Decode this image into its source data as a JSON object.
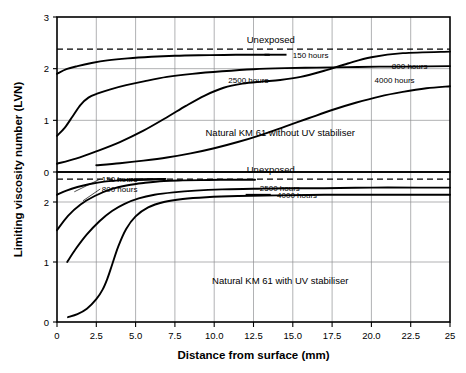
{
  "chart_data": {
    "type": "line",
    "title": "",
    "xlabel": "Distance from surface (mm)",
    "ylabel": "Limiting viscosity number (LVN)",
    "xlim": [
      0,
      25
    ],
    "xticks": [
      "0",
      "2.5",
      "5.0",
      "7.5",
      "10.0",
      "12.5",
      "15.0",
      "17.5",
      "20.0",
      "22.5",
      "25"
    ],
    "xtick_values": [
      0,
      2.5,
      5,
      7.5,
      10,
      12.5,
      15,
      17.5,
      20,
      22.5,
      25
    ],
    "grid": true,
    "legend_position": "inline-annotations",
    "panels": [
      {
        "name": "top",
        "annotation": "Natural KM 61 without UV stabiliser",
        "unexposed_label": "Unexposed",
        "unexposed_value": 2.38,
        "ylim": [
          0,
          3
        ],
        "yticks": [
          "0",
          "1",
          "2",
          "3"
        ],
        "ytick_values": [
          0,
          1,
          2,
          3
        ],
        "series": [
          {
            "name": "150 hours",
            "label": "150 hours",
            "x": [
              0,
              0.6,
              1.3,
              2.2,
              3.2,
              4.5,
              6.0,
              7.5,
              9.0,
              10.6,
              12.0,
              13.5
            ],
            "y": [
              1.9,
              1.99,
              2.05,
              2.11,
              2.16,
              2.2,
              2.23,
              2.25,
              2.26,
              2.265,
              2.27,
              2.27
            ]
          },
          {
            "name": "800 hours",
            "label": "800 hours",
            "x": [
              0,
              0.5,
              1.0,
              1.5,
              2.0,
              2.6,
              3.4,
              4.4,
              5.6,
              7.0,
              8.6,
              10.5,
              12.5,
              14.5,
              16.5,
              18.5,
              20.5,
              22.5,
              25
            ],
            "y": [
              0.7,
              0.86,
              1.08,
              1.3,
              1.44,
              1.52,
              1.6,
              1.68,
              1.76,
              1.84,
              1.9,
              1.95,
              1.99,
              2.01,
              2.02,
              2.03,
              2.04,
              2.04,
              2.05
            ]
          },
          {
            "name": "2500 hours",
            "label": "2500 hours",
            "x": [
              0,
              1.2,
              2.5,
              4.0,
              5.5,
              7.0,
              8.2,
              9.4,
              10.6,
              11.8,
              13.0,
              14.2,
              15.5,
              17.0,
              18.5,
              20.0,
              22.0,
              25
            ],
            "y": [
              0.16,
              0.26,
              0.4,
              0.58,
              0.8,
              1.06,
              1.28,
              1.48,
              1.63,
              1.71,
              1.75,
              1.78,
              1.84,
              1.96,
              2.1,
              2.22,
              2.3,
              2.33
            ]
          },
          {
            "name": "4000 hours",
            "label": "4000 hours",
            "x": [
              2.5,
              4.0,
              5.5,
              7.0,
              8.5,
              10.0,
              11.5,
              13.0,
              14.5,
              16.0,
              17.5,
              19.0,
              20.5,
              22.0,
              23.5,
              25
            ],
            "y": [
              0.13,
              0.17,
              0.22,
              0.28,
              0.36,
              0.46,
              0.58,
              0.72,
              0.88,
              1.04,
              1.2,
              1.34,
              1.46,
              1.55,
              1.62,
              1.66
            ]
          }
        ]
      },
      {
        "name": "bottom",
        "annotation": "Natural KM 61 with UV stabiliser",
        "unexposed_label": "Unexposed",
        "unexposed_value": 2.38,
        "ylim": [
          0,
          2.5
        ],
        "yticks": [
          "0",
          "1",
          "2"
        ],
        "ytick_values": [
          0,
          1,
          2
        ],
        "series": [
          {
            "name": "150 hours",
            "label": "150 hours",
            "x": [
              0,
              0.6,
              1.3,
              2.1,
              3.0,
              4.0,
              5.0,
              6.0,
              6.9
            ],
            "y": [
              2.12,
              2.19,
              2.25,
              2.3,
              2.34,
              2.36,
              2.375,
              2.38,
              2.385
            ]
          },
          {
            "name": "800 hours",
            "label": "800 hours",
            "x": [
              0,
              0.7,
              1.5,
              2.4,
              3.4,
              4.5,
              5.6,
              6.8,
              8.0,
              9.2,
              10.4,
              11.6,
              12.6
            ],
            "y": [
              1.53,
              1.77,
              1.96,
              2.1,
              2.21,
              2.28,
              2.32,
              2.35,
              2.36,
              2.365,
              2.37,
              2.37,
              2.37
            ]
          },
          {
            "name": "2500 hours",
            "label": "2500 hours",
            "x": [
              0.65,
              1.2,
              1.9,
              2.7,
              3.5,
              4.3,
              5.2,
              6.2,
              7.4,
              8.8,
              10.5,
              12.5,
              14.5,
              17.0,
              20.0,
              23.0,
              25
            ],
            "y": [
              1.0,
              1.22,
              1.46,
              1.68,
              1.85,
              1.97,
              2.06,
              2.12,
              2.16,
              2.19,
              2.21,
              2.22,
              2.23,
              2.23,
              2.24,
              2.24,
              2.24
            ]
          },
          {
            "name": "4000 hours",
            "label": "4000 hours",
            "x": [
              0.7,
              1.3,
              1.9,
              2.5,
              2.9,
              3.2,
              3.5,
              3.9,
              4.4,
              5.0,
              5.8,
              6.8,
              8.0,
              9.5,
              11.5,
              14.0,
              17.0,
              20.0,
              23.0,
              25
            ],
            "y": [
              0.08,
              0.13,
              0.22,
              0.38,
              0.54,
              0.72,
              0.95,
              1.26,
              1.55,
              1.76,
              1.91,
              2.0,
              2.05,
              2.08,
              2.1,
              2.11,
              2.12,
              2.12,
              2.12,
              2.12
            ]
          }
        ]
      }
    ]
  }
}
